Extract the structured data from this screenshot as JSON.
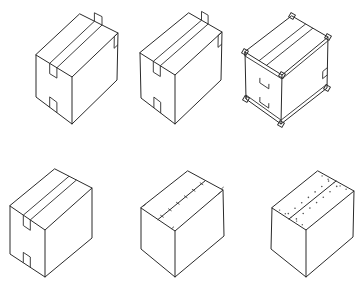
{
  "figure": {
    "background": "#ffffff",
    "line_color": "#2a2a2a",
    "boxes": [
      {
        "id": "box-1",
        "closure": "tape strip over top seam, extending down front and back faces with corner tabs",
        "corners": {
          "top_back": [
            80,
            14
          ],
          "top_left": [
            36,
            55
          ],
          "top_front": [
            72,
            77
          ],
          "top_right": [
            118,
            33
          ],
          "bottom_left": [
            36,
            97
          ],
          "bottom_front": [
            72,
            124
          ],
          "bottom_right": [
            117,
            80
          ]
        },
        "tape": true,
        "corner_tabs": "back",
        "staples": false,
        "dots": false
      },
      {
        "id": "box-2",
        "closure": "tape strip over top seam with tabs at back corners",
        "corners": {
          "top_back": [
            189,
            13
          ],
          "top_left": [
            140,
            53
          ],
          "top_front": [
            175,
            75
          ],
          "top_right": [
            222,
            32
          ],
          "bottom_left": [
            141,
            98
          ],
          "bottom_front": [
            175,
            124
          ],
          "bottom_right": [
            221,
            80
          ]
        },
        "tape": true,
        "corner_tabs": "back-both",
        "staples": false,
        "dots": false
      },
      {
        "id": "box-3",
        "closure": "tape strip with edge bands and corner protectors on all edges",
        "corners": {
          "top_back": [
            292,
            16
          ],
          "top_left": [
            245,
            52
          ],
          "top_front": [
            282,
            75
          ],
          "top_right": [
            328,
            37
          ],
          "bottom_left": [
            246,
            99
          ],
          "bottom_front": [
            281,
            124
          ],
          "bottom_right": [
            327,
            88
          ]
        },
        "tape": true,
        "corner_tabs": "all",
        "staples": false,
        "dots": false
      },
      {
        "id": "box-4",
        "closure": "tape strip over top seam extending down front face",
        "corners": {
          "top_back": [
            55,
            169
          ],
          "top_left": [
            10,
            206
          ],
          "top_front": [
            45,
            230
          ],
          "top_right": [
            92,
            188
          ],
          "bottom_left": [
            10,
            254
          ],
          "bottom_front": [
            45,
            277
          ],
          "bottom_right": [
            92,
            238
          ]
        },
        "tape": true,
        "corner_tabs": "none",
        "staples": false,
        "dots": false
      },
      {
        "id": "box-5",
        "closure": "stapled top seam",
        "corners": {
          "top_back": [
            188,
            171
          ],
          "top_left": [
            141,
            208
          ],
          "top_front": [
            175,
            231
          ],
          "top_right": [
            223,
            190
          ],
          "bottom_left": [
            141,
            249
          ],
          "bottom_front": [
            175,
            277
          ],
          "bottom_right": [
            224,
            236
          ]
        },
        "tape": false,
        "corner_tabs": "none",
        "staples": true,
        "dots": false
      },
      {
        "id": "box-6",
        "closure": "glued / dotted adhesive top seam",
        "corners": {
          "top_back": [
            318,
            171
          ],
          "top_left": [
            272,
            208
          ],
          "top_front": [
            306,
            230
          ],
          "top_right": [
            354,
            191
          ],
          "bottom_left": [
            271,
            249
          ],
          "bottom_front": [
            306,
            277
          ],
          "bottom_right": [
            353,
            237
          ]
        },
        "tape": false,
        "corner_tabs": "none",
        "staples": false,
        "dots": true
      }
    ]
  }
}
